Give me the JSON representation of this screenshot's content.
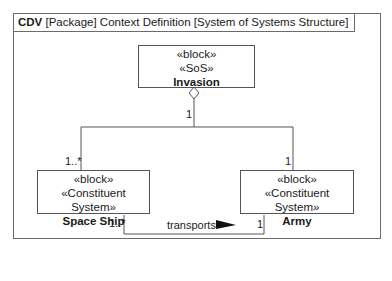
{
  "frame": {
    "kind": "CDV",
    "header": "[Package] Context Definition [System of Systems Structure]"
  },
  "blocks": {
    "invasion": {
      "stereotypes": [
        "«block»",
        "«SoS»"
      ],
      "name": "Invasion"
    },
    "space_ship": {
      "stereotypes": [
        "«block»",
        "«Constituent System»"
      ],
      "name": "Space Ship"
    },
    "army": {
      "stereotypes": [
        "«block»",
        "«Constituent System»"
      ],
      "name": "Army"
    }
  },
  "relationships": {
    "composition": {
      "whole_multiplicity": "1",
      "space_ship_multiplicity": "1..*",
      "army_multiplicity": "1"
    },
    "association": {
      "label": "transports",
      "direction_icon": "right-triangle-arrow",
      "space_ship_end": "1..*",
      "army_end": "1"
    }
  },
  "colors": {
    "line": "#555555",
    "frame": "#6b6b6b",
    "text": "#1a1a1a"
  }
}
